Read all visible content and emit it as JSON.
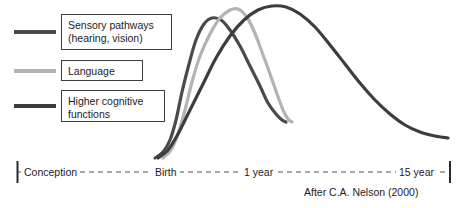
{
  "figure": {
    "background": "#ffffff",
    "attribution": "After C.A. Nelson (2000)"
  },
  "legend": {
    "items": [
      {
        "label": "Sensory pathways\n(hearing, vision)",
        "swatch_name": "legend-swatch-sensory",
        "color": "#4a4a4a"
      },
      {
        "label": "Language",
        "swatch_name": "legend-swatch-language",
        "color": "#b3b3b3"
      },
      {
        "label": "Higher cognitive\nfunctions",
        "swatch_name": "legend-swatch-higher-cognitive",
        "color": "#3d3d3d"
      }
    ]
  },
  "axis": {
    "line_style": "dashed",
    "line_color": "#8c8c8c",
    "tick_color": "#2b2b2b",
    "ticks": [
      {
        "label": "Conception",
        "x": 17
      },
      {
        "label": "Birth",
        "x": 170
      },
      {
        "label": "1 year",
        "x": 260
      },
      {
        "label": "15 year",
        "x": 450
      }
    ],
    "labels": {
      "conception": "Conception",
      "birth": "Birth",
      "one_year": "1 year",
      "fifteen_year": "15 year"
    }
  },
  "chart_data": {
    "type": "line",
    "title": "",
    "subtitle": "",
    "xlabel": "",
    "ylabel": "Synapse formation / brain development intensity",
    "xlim": [
      0,
      474
    ],
    "ylim": [
      0,
      160
    ],
    "grid": false,
    "legend_position": "top-left",
    "x_axis_type": "nonlinear-age-scale",
    "x_tick_labels": [
      "Conception",
      "Birth",
      "1 year",
      "15 year"
    ],
    "annotations": [
      "After C.A. Nelson (2000)"
    ],
    "series": [
      {
        "name": "Sensory pathways (hearing, vision)",
        "color": "#4a4a4a",
        "width": 3.2,
        "peak_label": "peaks shortly after birth",
        "points": [
          [
            155,
            158
          ],
          [
            163,
            152
          ],
          [
            170,
            140
          ],
          [
            176,
            120
          ],
          [
            182,
            92
          ],
          [
            189,
            64
          ],
          [
            196,
            40
          ],
          [
            204,
            24
          ],
          [
            212,
            18
          ],
          [
            221,
            20
          ],
          [
            230,
            30
          ],
          [
            240,
            46
          ],
          [
            250,
            66
          ],
          [
            260,
            86
          ],
          [
            268,
            103
          ],
          [
            276,
            114
          ],
          [
            282,
            120
          ],
          [
            286,
            122
          ]
        ]
      },
      {
        "name": "Language",
        "color": "#b3b3b3",
        "width": 3.2,
        "peak_label": "peaks near 9 months",
        "points": [
          [
            163,
            158
          ],
          [
            171,
            150
          ],
          [
            178,
            134
          ],
          [
            185,
            110
          ],
          [
            192,
            82
          ],
          [
            200,
            56
          ],
          [
            210,
            34
          ],
          [
            220,
            18
          ],
          [
            230,
            10
          ],
          [
            238,
            9
          ],
          [
            246,
            16
          ],
          [
            254,
            31
          ],
          [
            262,
            52
          ],
          [
            270,
            74
          ],
          [
            277,
            94
          ],
          [
            283,
            110
          ],
          [
            288,
            119
          ],
          [
            292,
            122
          ]
        ]
      },
      {
        "name": "Higher cognitive functions",
        "color": "#3d3d3d",
        "width": 3.2,
        "peak_label": "peaks in early childhood, declines to 15 years",
        "points": [
          [
            158,
            158
          ],
          [
            168,
            150
          ],
          [
            178,
            134
          ],
          [
            190,
            110
          ],
          [
            203,
            84
          ],
          [
            216,
            58
          ],
          [
            230,
            36
          ],
          [
            244,
            20
          ],
          [
            258,
            10
          ],
          [
            272,
            6
          ],
          [
            286,
            7
          ],
          [
            300,
            14
          ],
          [
            315,
            27
          ],
          [
            330,
            45
          ],
          [
            345,
            64
          ],
          [
            360,
            83
          ],
          [
            375,
            100
          ],
          [
            390,
            114
          ],
          [
            405,
            125
          ],
          [
            420,
            132
          ],
          [
            435,
            136
          ],
          [
            448,
            138
          ]
        ]
      }
    ]
  }
}
